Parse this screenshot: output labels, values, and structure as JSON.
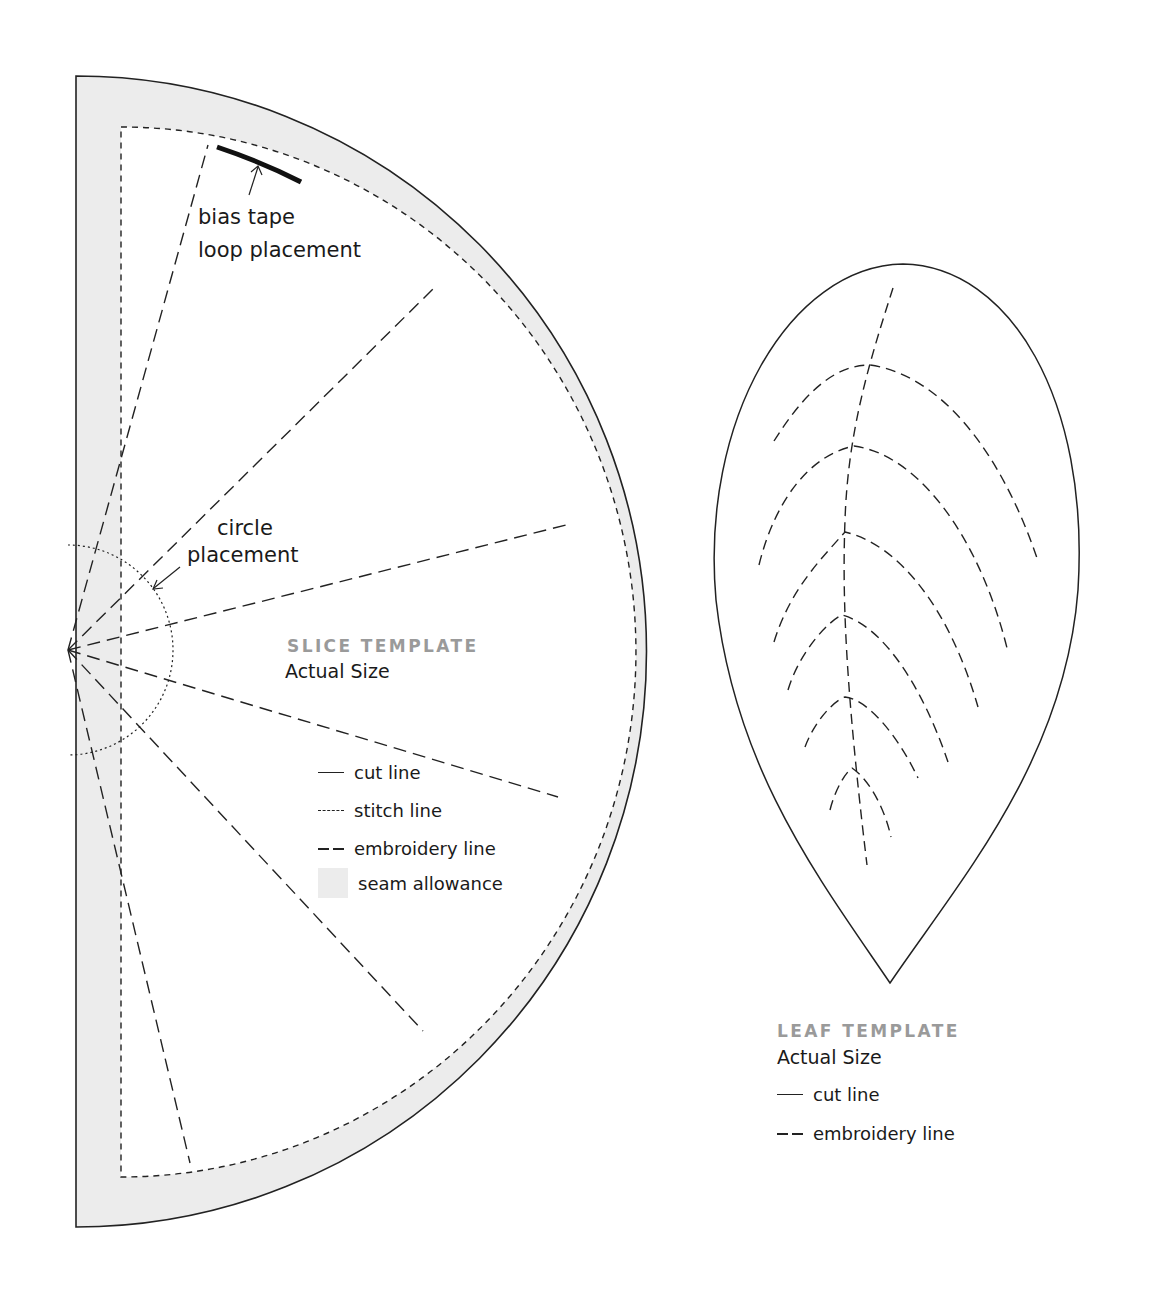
{
  "slice_template": {
    "title": "SLICE TEMPLATE",
    "subtitle": "Actual Size",
    "annotations": {
      "bias_tape_line1": "bias tape",
      "bias_tape_line2": "loop placement",
      "circle_line1": "circle",
      "circle_line2": "placement"
    },
    "legend": [
      {
        "style": "solid",
        "label": "cut line"
      },
      {
        "style": "short-dash",
        "label": "stitch line"
      },
      {
        "style": "long-dash",
        "label": "embroidery line"
      },
      {
        "style": "gray-fill",
        "label": "seam allowance"
      }
    ]
  },
  "leaf_template": {
    "title": "LEAF TEMPLATE",
    "subtitle": "Actual Size",
    "legend": [
      {
        "style": "solid",
        "label": "cut line"
      },
      {
        "style": "long-dash",
        "label": "embroidery line"
      }
    ]
  },
  "colors": {
    "seam_allowance": "#ececec",
    "line": "#222222",
    "title_gray": "#9a9a9a"
  }
}
